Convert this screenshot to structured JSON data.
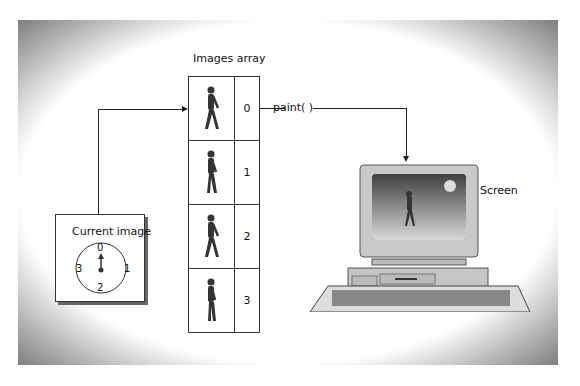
{
  "diagram": {
    "array_title": "Images array",
    "array_indices": [
      "0",
      "1",
      "2",
      "3"
    ],
    "paint_label": "paint( )",
    "screen_label": "Screen",
    "clock": {
      "title": "Current image",
      "positions": {
        "top": "0",
        "right": "1",
        "bottom": "2",
        "left": "3"
      },
      "pointing_to": "0"
    }
  }
}
